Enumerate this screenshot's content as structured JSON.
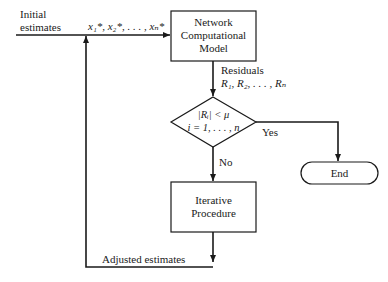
{
  "nodes": {
    "model": {
      "line1": "Network",
      "line2": "Computational",
      "line3": "Model"
    },
    "decision": {
      "line1": "|Rᵢ| < μ",
      "line2": "i = 1, . . . , n"
    },
    "iterative": {
      "line1": "Iterative",
      "line2": "Procedure"
    },
    "end": {
      "label": "End"
    }
  },
  "labels": {
    "initial_line1": "Initial",
    "initial_line2": "estimates",
    "initial_vars": "x₁*, x₂*, . . . , xₙ*",
    "residuals_line1": "Residuals",
    "residuals_line2": "R₁, R₂, . . . , Rₙ",
    "yes": "Yes",
    "no": "No",
    "adjusted": "Adjusted estimates"
  },
  "colors": {
    "line": "#1a1a1a",
    "background": "#ffffff"
  }
}
